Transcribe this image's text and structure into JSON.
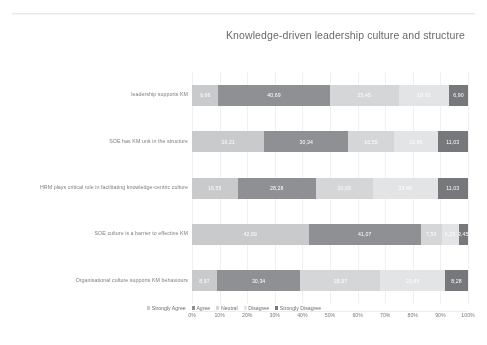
{
  "chart_data": {
    "type": "bar",
    "orientation": "horizontal",
    "stacked": true,
    "stack_mode": "percent",
    "title": "Knowledge-driven leadership culture and structure",
    "xlabel": "",
    "ylabel": "",
    "xlim": [
      0,
      100
    ],
    "grid": true,
    "legend_position": "bottom",
    "tick_labels": [
      "0%",
      "10%",
      "20%",
      "30%",
      "40%",
      "50%",
      "60%",
      "70%",
      "80%",
      "90%",
      "100%"
    ],
    "tick_values": [
      0,
      10,
      20,
      30,
      40,
      50,
      60,
      70,
      80,
      90,
      100
    ],
    "categories": [
      "leadership supports KM",
      "SOE has KM unit in the structure",
      "HRM plays critical role in facilitating knowledge-centric culture",
      "SOE culture is a barrier to effective KM",
      "Organisational culture supports KM behaviours"
    ],
    "series": [
      {
        "name": "Strongly Agree",
        "color": "#c9cacc",
        "values": [
          9.66,
          26.21,
          16.55,
          42.69,
          8.97
        ]
      },
      {
        "name": "Agree",
        "color": "#8e9093",
        "values": [
          40.69,
          30.34,
          28.28,
          41.07,
          30.34
        ]
      },
      {
        "name": "Neutral",
        "color": "#d5d6d8",
        "values": [
          25.45,
          16.55,
          20.69,
          7.59,
          28.97
        ]
      },
      {
        "name": "Disagree",
        "color": "#e3e4e5",
        "values": [
          18.31,
          15.86,
          23.45,
          6.23,
          23.45
        ]
      },
      {
        "name": "Strongly Disagree",
        "color": "#76787b",
        "values": [
          6.9,
          11.03,
          11.03,
          3.45,
          8.28
        ]
      }
    ],
    "bar_labels": [
      [
        "9,66",
        "40,69",
        "25,45",
        "18,31",
        "6,90"
      ],
      [
        "26,21",
        "30,34",
        "16,55",
        "15,86",
        "11,03"
      ],
      [
        "16,55",
        "28,28",
        "20,69",
        "23,45",
        "11,03"
      ],
      [
        "42,69",
        "41,07",
        "7,59",
        "6,23",
        "3,45"
      ],
      [
        "8,97",
        "30,34",
        "28,97",
        "23,45",
        "8,28"
      ]
    ]
  }
}
